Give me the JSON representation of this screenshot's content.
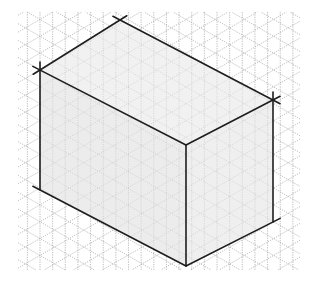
{
  "diagram": {
    "type": "isometric-box-on-grid",
    "canvas": {
      "width": 313,
      "height": 282
    },
    "colors": {
      "background": "#ffffff",
      "grid": "#9a9a9a",
      "edge": "#1e1e1e",
      "face_top": "#f1f1f1",
      "face_left": "#ececec",
      "face_right": "#efefef"
    },
    "grid": {
      "spacing": 14.6,
      "region": {
        "x0": 18,
        "y0": 12,
        "x1": 300,
        "y1": 270
      },
      "directions": [
        "vertical",
        "diagonal-down",
        "diagonal-up"
      ]
    },
    "vertices": {
      "top_back": [
        120,
        20
      ],
      "top_left": [
        40,
        70
      ],
      "top_right": [
        273,
        100
      ],
      "top_front": [
        186,
        145
      ],
      "bottom_left": [
        40,
        190
      ],
      "bottom_front": [
        186,
        266
      ],
      "bottom_right": [
        273,
        222
      ]
    },
    "edge_overshoot": 8
  }
}
